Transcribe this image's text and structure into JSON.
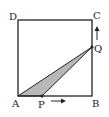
{
  "diagram": {
    "type": "geometry-square",
    "points": {
      "A": {
        "label": "A",
        "x": 18,
        "y": 96
      },
      "B": {
        "label": "B",
        "x": 92,
        "y": 96
      },
      "C": {
        "label": "C",
        "x": 92,
        "y": 20
      },
      "D": {
        "label": "D",
        "x": 18,
        "y": 20
      },
      "P": {
        "label": "P",
        "x": 42,
        "y": 96
      },
      "Q": {
        "label": "Q",
        "x": 92,
        "y": 47
      }
    },
    "shaded_triangle": [
      "A",
      "P",
      "Q"
    ],
    "shade_color": "#b8b8b8",
    "line_color": "#222222",
    "arrows": [
      {
        "from": "P",
        "direction": "right"
      },
      {
        "from": "Q",
        "direction": "up"
      }
    ]
  }
}
